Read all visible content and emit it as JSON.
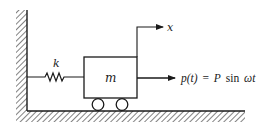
{
  "diagram": {
    "labels": {
      "spring": "k",
      "mass": "m",
      "displacement": "x",
      "force_lhs": "p(t)",
      "force_eq": "=",
      "force_amp": "P",
      "force_fn": "sin",
      "force_arg": "ωt"
    },
    "colors": {
      "line": "#1a1a1a",
      "background": "#ffffff"
    }
  }
}
